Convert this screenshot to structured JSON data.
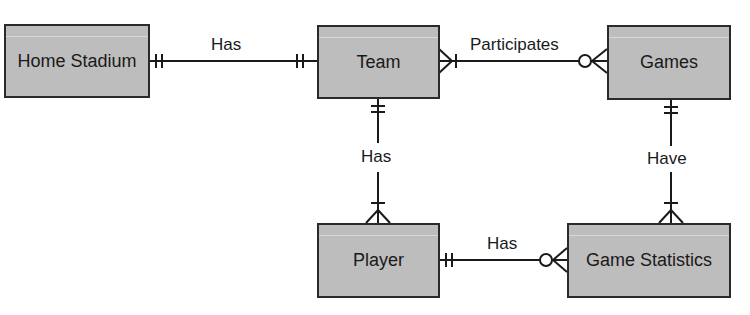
{
  "diagram": {
    "type": "entity-relationship",
    "colors": {
      "entity_fill": "#bdbdbd",
      "entity_border": "#2a2a2a",
      "line": "#1a1a1a"
    },
    "entities": [
      {
        "id": "home_stadium",
        "label": "Home Stadium"
      },
      {
        "id": "team",
        "label": "Team"
      },
      {
        "id": "games",
        "label": "Games"
      },
      {
        "id": "player",
        "label": "Player"
      },
      {
        "id": "game_statistics",
        "label": "Game Statistics"
      }
    ],
    "relationships": [
      {
        "label": "Has",
        "from": "Home Stadium",
        "to": "Team",
        "from_cardinality": "one-and-only-one",
        "to_cardinality": "one-and-only-one"
      },
      {
        "label": "Participates",
        "from": "Team",
        "to": "Games",
        "from_cardinality": "one-or-many",
        "to_cardinality": "zero-or-many"
      },
      {
        "label": "Has",
        "from": "Team",
        "to": "Player",
        "from_cardinality": "one-and-only-one",
        "to_cardinality": "one-or-many"
      },
      {
        "label": "Have",
        "from": "Games",
        "to": "Game Statistics",
        "from_cardinality": "one-and-only-one",
        "to_cardinality": "one-or-many"
      },
      {
        "label": "Has",
        "from": "Player",
        "to": "Game Statistics",
        "from_cardinality": "one-and-only-one",
        "to_cardinality": "zero-or-many"
      }
    ]
  }
}
